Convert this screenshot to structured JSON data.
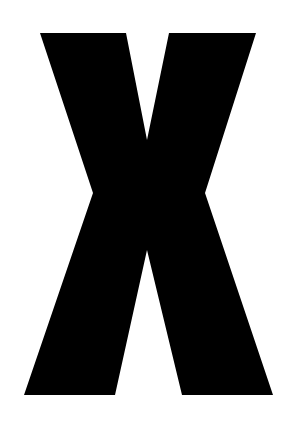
{
  "glyph": {
    "character": "X",
    "fill_color": "#000000",
    "background_color": "#ffffff",
    "points": "40,33 126,33 147,140 169,33 256,33 205,193 273,395 182,395 147,250 115,395 24,395 93,193"
  }
}
